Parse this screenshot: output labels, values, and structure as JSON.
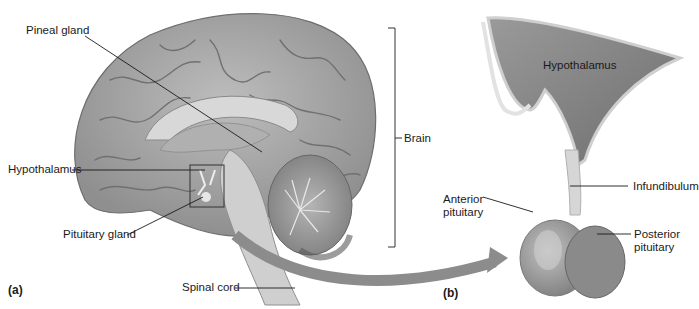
{
  "figure": {
    "panels": [
      {
        "id": "a",
        "label": "(a)",
        "title": "Brain sagittal section"
      },
      {
        "id": "b",
        "label": "(b)",
        "title": "Hypothalamus and pituitary enlargement"
      }
    ],
    "panel_a": {
      "labels": {
        "pineal_gland": "Pineal gland",
        "hypothalamus": "Hypothalamus",
        "pituitary_gland": "Pituitary gland",
        "spinal_cord": "Spinal cord",
        "brain": "Brain"
      }
    },
    "panel_b": {
      "labels": {
        "hypothalamus": "Hypothalamus",
        "infundibulum": "Infundibulum",
        "anterior_pituitary": "Anterior\npituitary",
        "posterior_pituitary": "Posterior\npituitary"
      }
    },
    "colors": {
      "brain": "#a9a9a9",
      "sulci": "#6e6e6e",
      "arrow": "#8c8c8c",
      "leader_lines": "#1a1a1a"
    }
  }
}
